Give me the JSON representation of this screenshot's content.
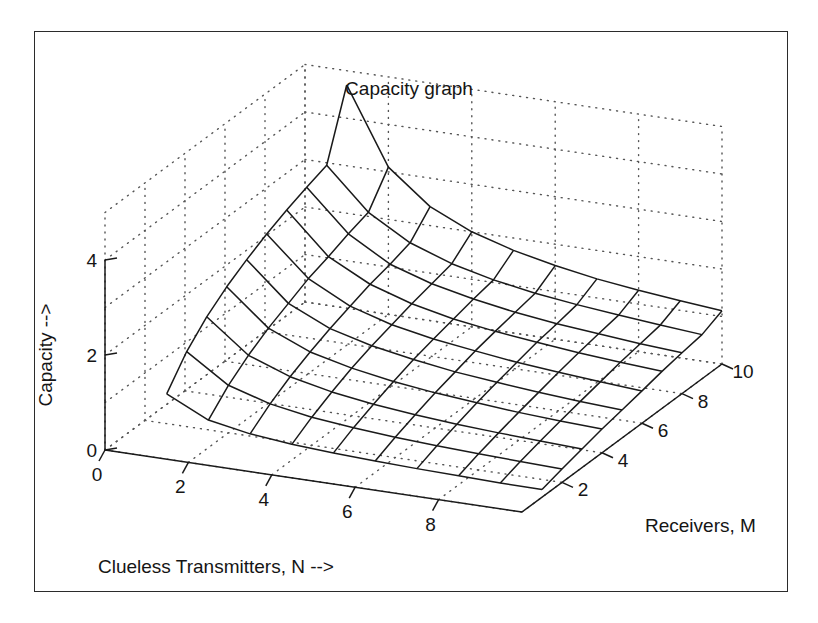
{
  "title": "Capacity graph",
  "axes": {
    "x": {
      "label": "Clueless Transmitters, N  -->",
      "ticks": [
        "0",
        "2",
        "4",
        "6",
        "8"
      ],
      "tick_values": [
        0,
        2,
        4,
        6,
        8
      ],
      "range": [
        0,
        10
      ]
    },
    "y": {
      "label": "Receivers, M",
      "ticks": [
        "2",
        "4",
        "6",
        "8",
        "10"
      ],
      "tick_values": [
        2,
        4,
        6,
        8,
        10
      ],
      "range": [
        0,
        10
      ]
    },
    "z": {
      "label": "Capacity -->",
      "ticks": [
        "0",
        "2",
        "4"
      ],
      "tick_values": [
        0,
        2,
        4
      ],
      "range": [
        0,
        5
      ]
    }
  },
  "colors": {
    "frame": "#2b2b2b",
    "mesh": "#1a1a1a",
    "grid": "#555555",
    "text": "#151515",
    "background": "#ffffff"
  },
  "chart_data": {
    "type": "surface",
    "title": "Capacity graph",
    "xlabel": "Clueless Transmitters, N  -->",
    "ylabel": "Receivers, M",
    "zlabel": "Capacity -->",
    "xlim": [
      0,
      10
    ],
    "ylim": [
      0,
      10
    ],
    "zlim": [
      0,
      5
    ],
    "grid": true,
    "legend": "none",
    "x": [
      1,
      2,
      3,
      4,
      5,
      6,
      7,
      8,
      9,
      10
    ],
    "y": [
      1,
      2,
      3,
      4,
      5,
      6,
      7,
      8,
      9,
      10
    ],
    "z_rows_note": "z[i][j] = capacity at y = M_i, x = N_j; rows ordered M=1..10, columns N=1..10",
    "z": [
      [
        1.0,
        0.58,
        0.42,
        0.33,
        0.28,
        0.24,
        0.21,
        0.19,
        0.17,
        0.16
      ],
      [
        1.58,
        1.0,
        0.74,
        0.59,
        0.5,
        0.43,
        0.38,
        0.34,
        0.31,
        0.28
      ],
      [
        2.0,
        1.32,
        1.0,
        0.81,
        0.68,
        0.59,
        0.52,
        0.47,
        0.43,
        0.39
      ],
      [
        2.32,
        1.58,
        1.21,
        1.0,
        0.85,
        0.74,
        0.66,
        0.59,
        0.54,
        0.5
      ],
      [
        2.58,
        1.79,
        1.39,
        1.16,
        1.0,
        0.87,
        0.78,
        0.7,
        0.64,
        0.59
      ],
      [
        2.81,
        2.0,
        1.55,
        1.29,
        1.12,
        1.0,
        0.89,
        0.81,
        0.74,
        0.68
      ],
      [
        3.0,
        2.15,
        1.7,
        1.42,
        1.23,
        1.1,
        1.0,
        0.91,
        0.84,
        0.78
      ],
      [
        3.17,
        2.32,
        1.81,
        1.53,
        1.34,
        1.19,
        1.08,
        1.0,
        0.92,
        0.86
      ],
      [
        3.32,
        2.46,
        1.95,
        1.64,
        1.43,
        1.28,
        1.17,
        1.08,
        1.0,
        0.93
      ],
      [
        4.7,
        3.1,
        2.4,
        2.0,
        1.74,
        1.55,
        1.4,
        1.29,
        1.2,
        1.12
      ]
    ]
  },
  "projection": {
    "note": "screen coordinates of the 3D box corners used to render the surface",
    "origin": [
      105,
      450
    ],
    "x_axis_end": [
      522,
      512
    ],
    "y_axis_end": [
      722,
      364
    ],
    "z_unit_px": 47.5
  }
}
